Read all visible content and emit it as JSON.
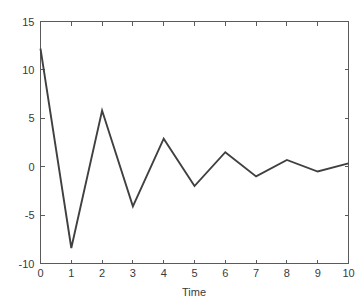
{
  "chart_data": {
    "type": "line",
    "title": "",
    "subtitle": "",
    "xlabel": "Time",
    "ylabel": "",
    "x": [
      0,
      1,
      2,
      3,
      4,
      5,
      6,
      7,
      8,
      9,
      10
    ],
    "values": [
      12.2,
      -8.4,
      5.8,
      -4.1,
      2.9,
      -2.0,
      1.5,
      -1.0,
      0.7,
      -0.5,
      0.35
    ],
    "series": [
      {
        "name": "response",
        "values": [
          12.2,
          -8.4,
          5.8,
          -4.1,
          2.9,
          -2.0,
          1.5,
          -1.0,
          0.7,
          -0.5,
          0.35
        ]
      }
    ],
    "xlim": [
      0,
      10
    ],
    "ylim": [
      -10,
      15
    ],
    "xticks": [
      0,
      1,
      2,
      3,
      4,
      5,
      6,
      7,
      8,
      9,
      10
    ],
    "xtick_labels": [
      "0",
      "1",
      "2",
      "3",
      "4",
      "5",
      "6",
      "7",
      "8",
      "9",
      "10"
    ],
    "yticks": [
      -10,
      -5,
      0,
      5,
      10,
      15
    ],
    "ytick_labels": [
      "-10",
      "-5",
      "0",
      "5",
      "10",
      "15"
    ],
    "grid": false,
    "legend": false,
    "legend_position": "none",
    "line_color": "#404040",
    "axis_color": "#5a5a5a",
    "background_color": "#ffffff",
    "box": true,
    "tick_direction": "in"
  }
}
